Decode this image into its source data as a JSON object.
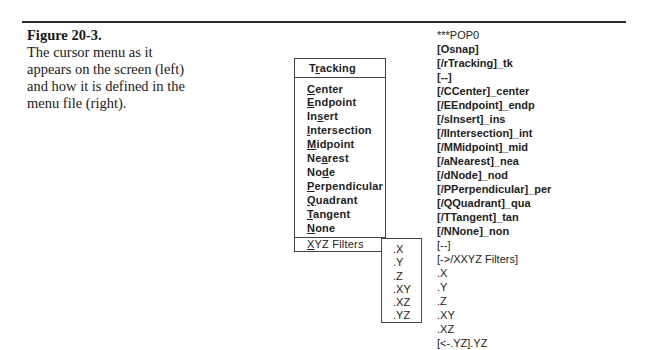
{
  "figure": {
    "title": "Figure 20-3.",
    "caption_lines": [
      "The cursor menu as it",
      "appears on the screen (left)",
      "and how it is defined in the",
      "menu file (right)."
    ]
  },
  "cursor_menu": {
    "header": {
      "pre": "T",
      "ul": "r",
      "post": "acking"
    },
    "items": [
      {
        "pre": "",
        "ul": "C",
        "post": "enter"
      },
      {
        "pre": "",
        "ul": "E",
        "post": "ndpoint"
      },
      {
        "pre": "In",
        "ul": "s",
        "post": "ert"
      },
      {
        "pre": "",
        "ul": "I",
        "post": "ntersection"
      },
      {
        "pre": "",
        "ul": "M",
        "post": "idpoint"
      },
      {
        "pre": "Ne",
        "ul": "a",
        "post": "rest"
      },
      {
        "pre": "No",
        "ul": "d",
        "post": "e"
      },
      {
        "pre": "",
        "ul": "P",
        "post": "erpendicular"
      },
      {
        "pre": "",
        "ul": "Q",
        "post": "uadrant"
      },
      {
        "pre": "",
        "ul": "T",
        "post": "angent"
      },
      {
        "pre": "",
        "ul": "N",
        "post": "one"
      }
    ],
    "cascade_item": {
      "pre": "",
      "ul": "X",
      "post": "YZ Filters"
    }
  },
  "xyz_submenu": {
    "items": [
      ".X",
      ".Y",
      ".Z",
      ".XY",
      ".XZ",
      ".YZ"
    ]
  },
  "menu_file": {
    "lines": [
      {
        "text": "***POP0",
        "bold": false
      },
      {
        "text": "[Osnap]",
        "bold": true
      },
      {
        "text": "[/rTracking]_tk",
        "bold": true
      },
      {
        "text": "[--]",
        "bold": true
      },
      {
        "text": "[/CCenter]_center",
        "bold": true
      },
      {
        "text": "[/EEndpoint]_endp",
        "bold": true
      },
      {
        "text": "[/sInsert]_ins",
        "bold": true
      },
      {
        "text": "[/IIntersection]_int",
        "bold": true
      },
      {
        "text": "[/MMidpoint]_mid",
        "bold": true
      },
      {
        "text": "[/aNearest]_nea",
        "bold": true
      },
      {
        "text": "[/dNode]_nod",
        "bold": true
      },
      {
        "text": "[/PPerpendicular]_per",
        "bold": true
      },
      {
        "text": "[/QQuadrant]_qua",
        "bold": true
      },
      {
        "text": "[/TTangent]_tan",
        "bold": true
      },
      {
        "text": "[/NNone]_non",
        "bold": true
      },
      {
        "text": "[--]",
        "bold": false
      },
      {
        "text": "[->/XXYZ Filters]",
        "bold": false
      },
      {
        "text": ".X",
        "bold": false
      },
      {
        "text": ".Y",
        "bold": false
      },
      {
        "text": ".Z",
        "bold": false
      },
      {
        "text": ".XY",
        "bold": false
      },
      {
        "text": ".XZ",
        "bold": false
      },
      {
        "text": "[<-.YZ].YZ",
        "bold": false
      }
    ]
  }
}
